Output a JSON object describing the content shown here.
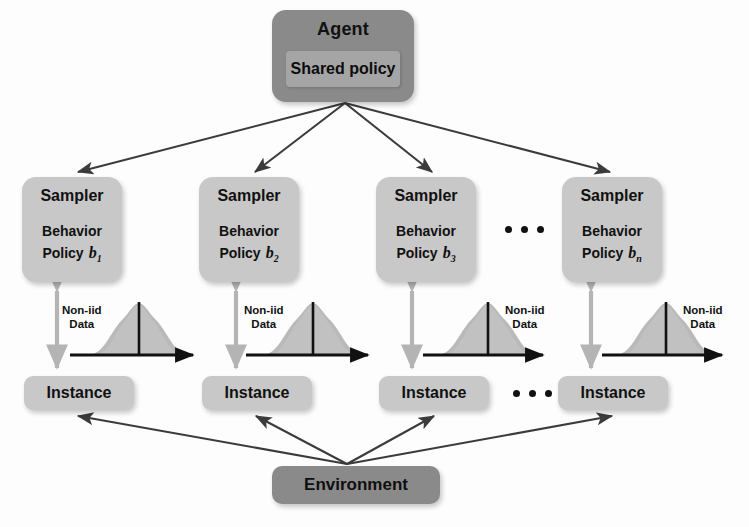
{
  "diagram": {
    "colors": {
      "agent_fill": "#8a8a8a",
      "shared_policy_fill": "#a5a5a5",
      "sampler_fill": "#c8c8c8",
      "instance_fill": "#c8c8c8",
      "environment_fill": "#8a8a8a",
      "arrow_dark": "#3b3b3b",
      "arrow_gray": "#b4b4b4",
      "curve_fill": "#b9b9b9",
      "text": "#111111"
    }
  },
  "agent": {
    "title": "Agent",
    "shared_policy": "Shared policy"
  },
  "samplers": [
    {
      "title": "Sampler",
      "line1": "Behavior",
      "line2": "Policy",
      "symbol": "b",
      "subscript": "1"
    },
    {
      "title": "Sampler",
      "line1": "Behavior",
      "line2": "Policy",
      "symbol": "b",
      "subscript": "2"
    },
    {
      "title": "Sampler",
      "line1": "Behavior",
      "line2": "Policy",
      "symbol": "b",
      "subscript": "3"
    },
    {
      "title": "Sampler",
      "line1": "Behavior",
      "line2": "Policy",
      "symbol": "b",
      "subscript": "n"
    }
  ],
  "instances": [
    {
      "label": "Instance"
    },
    {
      "label": "Instance"
    },
    {
      "label": "Instance"
    },
    {
      "label": "Instance"
    }
  ],
  "distributions": [
    {
      "label_line1": "Non-iid",
      "label_line2": "Data",
      "label_side": "left"
    },
    {
      "label_line1": "Non-iid",
      "label_line2": "Data",
      "label_side": "left"
    },
    {
      "label_line1": "Non-iid",
      "label_line2": "Data",
      "label_side": "right"
    },
    {
      "label_line1": "Non-iid",
      "label_line2": "Data",
      "label_side": "right"
    }
  ],
  "environment": {
    "label": "Environment"
  },
  "ellipses": {
    "sampler_row": "•••",
    "instance_row": "•••"
  }
}
